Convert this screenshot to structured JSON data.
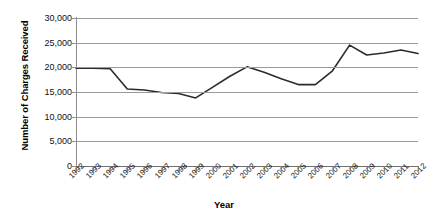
{
  "chart_data": {
    "type": "line",
    "title": "",
    "xlabel": "Year",
    "ylabel": "Number of Charges Received",
    "categories": [
      "1992",
      "1993",
      "1994",
      "1995",
      "1996",
      "1997",
      "1998",
      "1999",
      "2000",
      "2001",
      "2002",
      "2003",
      "2004",
      "2005",
      "2006",
      "2007",
      "2008",
      "2009",
      "2010",
      "2011",
      "2012"
    ],
    "values": [
      19800,
      19800,
      19700,
      15600,
      15400,
      14900,
      14700,
      13800,
      16000,
      18200,
      20100,
      19000,
      17700,
      16500,
      16500,
      19300,
      24500,
      22500,
      22900,
      23500,
      22800
    ],
    "series": [
      {
        "name": "Number of Charges Received",
        "values": [
          19800,
          19800,
          19700,
          15600,
          15400,
          14900,
          14700,
          13800,
          16000,
          18200,
          20100,
          19000,
          17700,
          16500,
          16500,
          19300,
          24500,
          22500,
          22900,
          23500,
          22800
        ]
      }
    ],
    "ylim": [
      0,
      30000
    ],
    "yticks": [
      0,
      5000,
      10000,
      15000,
      20000,
      25000,
      30000
    ],
    "ytick_labels": [
      "0",
      "5,000",
      "10,000",
      "15,000",
      "20,000",
      "25,000",
      "30,000"
    ],
    "grid": true,
    "legend": "none",
    "line_color": "#2b2b2b",
    "grid_color": "#9a9a9a",
    "background": "#ffffff"
  },
  "axes": {
    "y_title": "Number of Charges Received",
    "x_title": "Year"
  }
}
